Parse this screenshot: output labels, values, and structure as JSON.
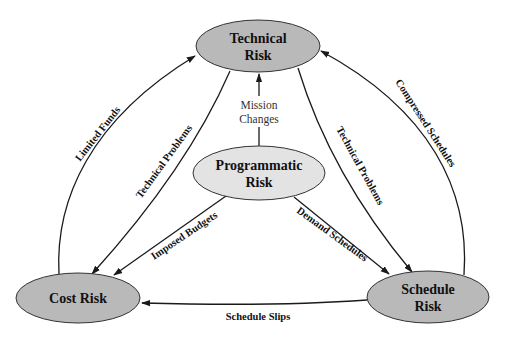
{
  "diagram": {
    "nodes": {
      "technical": {
        "line1": "Technical",
        "line2": "Risk",
        "fill": "#b9b9b9"
      },
      "programmatic": {
        "line1": "Programmatic",
        "line2": "Risk",
        "fill": "#e3e3e3"
      },
      "cost": {
        "line1": "Cost Risk",
        "fill": "#b9b9b9"
      },
      "schedule": {
        "line1": "Schedule",
        "line2": "Risk",
        "fill": "#b9b9b9"
      }
    },
    "edges": {
      "mission_changes": {
        "line1": "Mission",
        "line2": "Changes",
        "from": "Programmatic Risk",
        "to": "Technical Risk"
      },
      "limited_funds": {
        "label": "Limited Funds",
        "from": "Cost Risk",
        "to": "Technical Risk"
      },
      "technical_problems_left": {
        "label": "Technical Problems",
        "from": "Technical Risk",
        "to": "Cost Risk"
      },
      "technical_problems_right": {
        "label": "Technical Problems",
        "from": "Technical Risk",
        "to": "Schedule Risk"
      },
      "compressed_schedules": {
        "label": "Compressed Schedules",
        "from": "Schedule Risk",
        "to": "Technical Risk"
      },
      "imposed_budgets": {
        "label": "Imposed Budgets",
        "from": "Programmatic Risk",
        "to": "Cost Risk"
      },
      "demand_schedules": {
        "label": "Demand Schedules",
        "from": "Programmatic Risk",
        "to": "Schedule Risk"
      },
      "schedule_slips": {
        "label": "Schedule Slips",
        "from": "Schedule Risk",
        "to": "Cost Risk"
      }
    },
    "colors": {
      "stroke": "#1a1a1a",
      "background": "#ffffff"
    }
  }
}
